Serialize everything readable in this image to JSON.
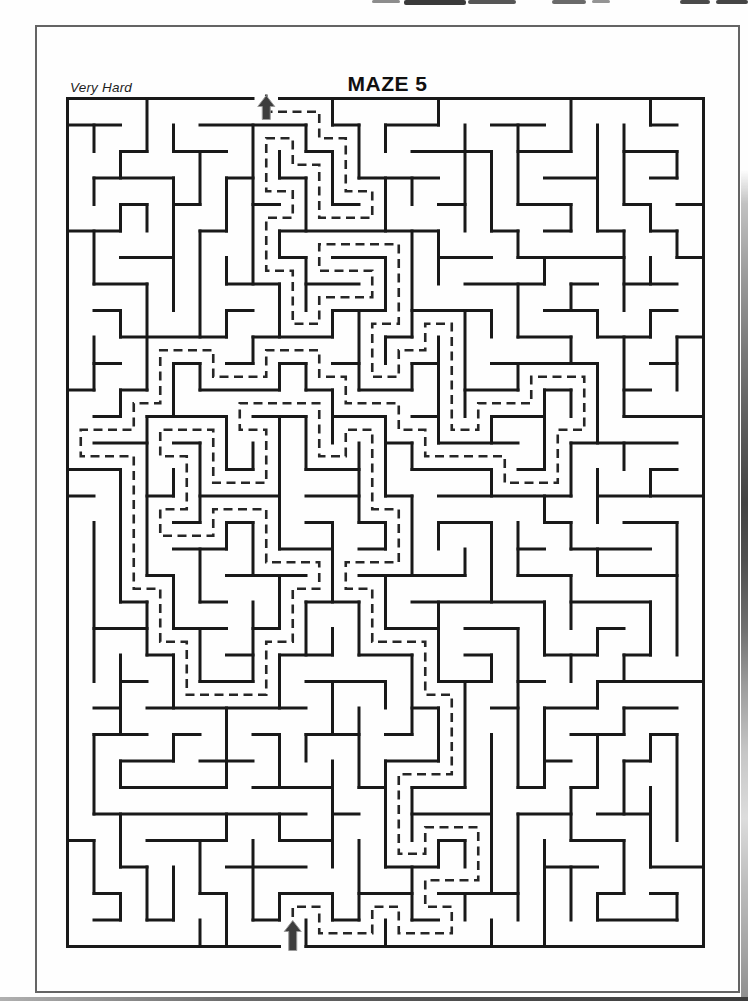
{
  "page": {
    "title": "MAZE 5",
    "difficulty": "Very Hard"
  },
  "maze": {
    "rows": 32,
    "cols": 24,
    "cell_px": 26.5,
    "seed": 5,
    "entrance_top_col": 7,
    "entrance_bottom_col": 8,
    "origin": {
      "x": 32.5,
      "y": 73.5
    },
    "wall": {
      "color": "#191919",
      "width": 3
    },
    "solution": {
      "color": "#262626",
      "width": 2.6,
      "dash": "9 5.5"
    },
    "arrows": {
      "color": "#3d3d3d",
      "outline": "#9a9a9a",
      "top": {
        "direction": "up",
        "meaning": "exit"
      },
      "bottom": {
        "direction": "up",
        "meaning": "start"
      }
    }
  }
}
